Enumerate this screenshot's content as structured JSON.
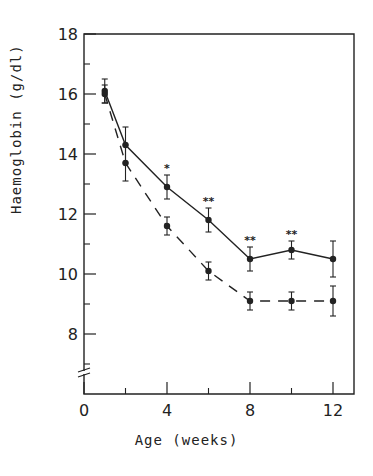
{
  "chart_data": {
    "type": "line",
    "title": "",
    "xlabel": "Age (weeks)",
    "ylabel": "Haemoglobin (g/dl)",
    "xlim": [
      0,
      13
    ],
    "ylim": [
      6,
      18
    ],
    "x_ticks_major": [
      0,
      4,
      8,
      12
    ],
    "x_ticks_minor": [
      2,
      6,
      10
    ],
    "y_ticks_major": [
      8,
      10,
      12,
      14,
      16,
      18
    ],
    "y_ticks_minor": [
      7,
      9,
      11,
      13,
      15,
      17
    ],
    "y_axis_break": true,
    "grid": false,
    "legend": null,
    "x": [
      1,
      2,
      4,
      6,
      8,
      10,
      12
    ],
    "series": [
      {
        "name": "solid line",
        "style": "solid",
        "values": [
          16.1,
          14.3,
          12.9,
          11.8,
          10.5,
          10.8,
          10.5
        ],
        "error": [
          0.4,
          0.6,
          0.4,
          0.4,
          0.4,
          0.3,
          0.6
        ]
      },
      {
        "name": "dashed line",
        "style": "dashed",
        "values": [
          16.0,
          13.7,
          11.6,
          10.1,
          9.1,
          9.1,
          9.1
        ],
        "error": [
          0.3,
          0.6,
          0.3,
          0.3,
          0.3,
          0.3,
          0.5
        ]
      }
    ],
    "annotations": [
      {
        "x": 4,
        "y": 13.6,
        "text": "*"
      },
      {
        "x": 6,
        "y": 12.5,
        "text": "**"
      },
      {
        "x": 8,
        "y": 11.2,
        "text": "**"
      },
      {
        "x": 10,
        "y": 11.4,
        "text": "**"
      }
    ]
  },
  "labels": {
    "xlabel": "Age (weeks)",
    "ylabel": "Haemoglobin (g/dl)"
  }
}
